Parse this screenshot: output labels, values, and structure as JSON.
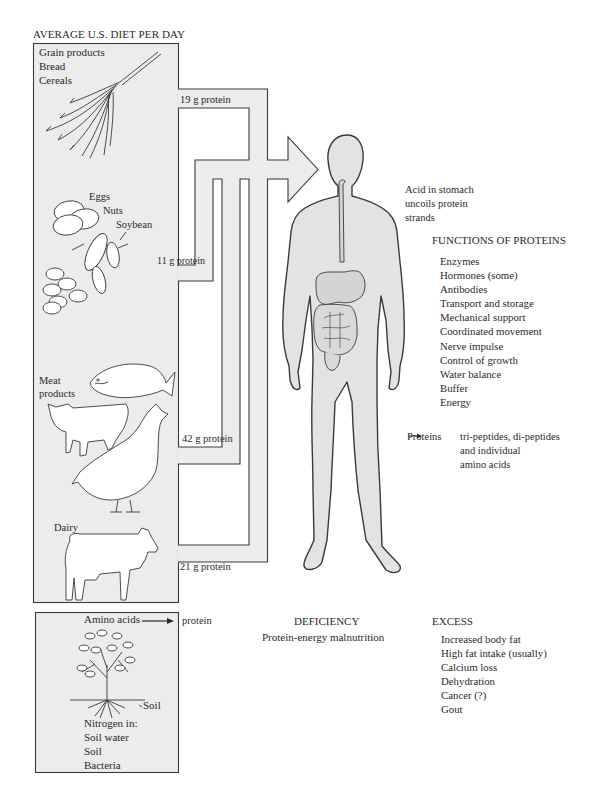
{
  "title": "AVERAGE U.S. DIET PER DAY",
  "colors": {
    "panel_fill": "#ececec",
    "body_fill": "#e3e3e3",
    "organ_fill": "#d4d4d4",
    "stroke": "#3a3a3a",
    "text": "#2a2a2a"
  },
  "sources": [
    {
      "id": "grain",
      "labels": [
        "Grain products",
        "Bread",
        "Cereals"
      ],
      "protein": "19 g protein",
      "icon": "wheat-icon"
    },
    {
      "id": "eggs",
      "labels": [
        "Eggs",
        "Nuts",
        "Soybean"
      ],
      "protein": "11 g protein",
      "icon": "eggs-nuts-icon"
    },
    {
      "id": "meat",
      "labels": [
        "Meat",
        "products"
      ],
      "protein": "42 g protein",
      "icon": "fish-cow-chicken-icon"
    },
    {
      "id": "dairy",
      "labels": [
        "Dairy"
      ],
      "protein": "21 g protein",
      "icon": "dairy-cow-icon"
    }
  ],
  "plant_box": {
    "amino_label": "Amino acids",
    "arrow_target": "protein",
    "soil_label": "Soil",
    "nitrogen_title": "Nitrogen in:",
    "nitrogen_items": [
      "Soil water",
      "Soil",
      "Bacteria"
    ]
  },
  "body": {
    "stomach_note": [
      "Acid in stomach",
      "uncoils protein",
      "strands"
    ],
    "functions_title": "FUNCTIONS OF PROTEINS",
    "functions": [
      "Enzymes",
      "Hormones (some)",
      "Antibodies",
      "Transport and storage",
      "Mechanical support",
      "Coordinated movement",
      "Nerve impulse",
      "Control of growth",
      "Water balance",
      "Buffer",
      "Energy"
    ],
    "breakdown": {
      "from": "Proteins",
      "arrow": "→",
      "to": [
        "tri-peptides, di-peptides",
        "and individual",
        "amino acids"
      ]
    }
  },
  "deficiency": {
    "title": "DEFICIENCY",
    "items": [
      "Protein-energy malnutrition"
    ]
  },
  "excess": {
    "title": "EXCESS",
    "items": [
      "Increased body fat",
      "High fat intake (usually)",
      "Calcium loss",
      "Dehydration",
      "Cancer (?)",
      "Gout"
    ]
  }
}
